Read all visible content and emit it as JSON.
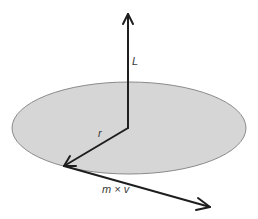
{
  "diagram": {
    "labels": {
      "angular_momentum": "L",
      "radius": "r",
      "momentum": "m × v"
    },
    "colors": {
      "disk_fill": "#d6d6d6",
      "disk_stroke": "#8a8a8a",
      "arrow": "#1e1e1e"
    },
    "shapes": {
      "disk": {
        "cx": 129,
        "cy": 128,
        "rx": 117,
        "ry": 46
      },
      "vector_L": {
        "from": [
          128,
          128
        ],
        "to": [
          128,
          14
        ]
      },
      "vector_r": {
        "from": [
          128,
          128
        ],
        "to": [
          64,
          166
        ]
      },
      "vector_mv": {
        "from": [
          64,
          166
        ],
        "to": [
          210,
          207
        ]
      }
    }
  }
}
